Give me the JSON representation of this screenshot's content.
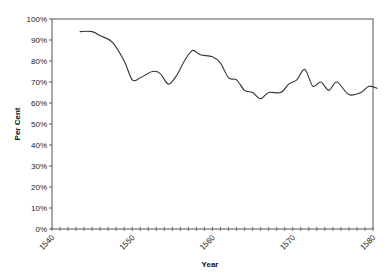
{
  "chart_data": {
    "type": "line",
    "title": "",
    "xlabel": "Year",
    "ylabel": "Per Cent",
    "xlim": [
      1540,
      1580
    ],
    "ylim": [
      0,
      100
    ],
    "x_tick_labels": [
      "1540",
      "1550",
      "1560",
      "1570",
      "1580"
    ],
    "x_tick_values": [
      1540,
      1550,
      1560,
      1570,
      1580
    ],
    "x_minor_tick_step": 1,
    "y_tick_labels": [
      "0%",
      "10%",
      "20%",
      "30%",
      "40%",
      "50%",
      "60%",
      "70%",
      "80%",
      "90%",
      "100%"
    ],
    "y_tick_values": [
      0,
      10,
      20,
      30,
      40,
      50,
      60,
      70,
      80,
      90,
      100
    ],
    "grid": false,
    "legend": null,
    "series": [
      {
        "name": "Per Cent",
        "color": "#333333",
        "x": [
          1543.5,
          1545,
          1546,
          1547.5,
          1549,
          1550,
          1551,
          1552.5,
          1553.5,
          1554.5,
          1555.5,
          1556.5,
          1557.5,
          1558.5,
          1560,
          1561,
          1562,
          1563,
          1564,
          1565,
          1566,
          1567,
          1568.5,
          1569.5,
          1570.5,
          1571.5,
          1572.5,
          1573.5,
          1574.5,
          1575.5,
          1577,
          1578.5,
          1579.5,
          1580.5
        ],
        "values": [
          94,
          94,
          92,
          89,
          80,
          71,
          72,
          75,
          74,
          69,
          73,
          80,
          85,
          83,
          82,
          79,
          72,
          71,
          66,
          65,
          62,
          65,
          65,
          69,
          71,
          76,
          68,
          70,
          66,
          70,
          64,
          65,
          68,
          67
        ]
      }
    ]
  }
}
